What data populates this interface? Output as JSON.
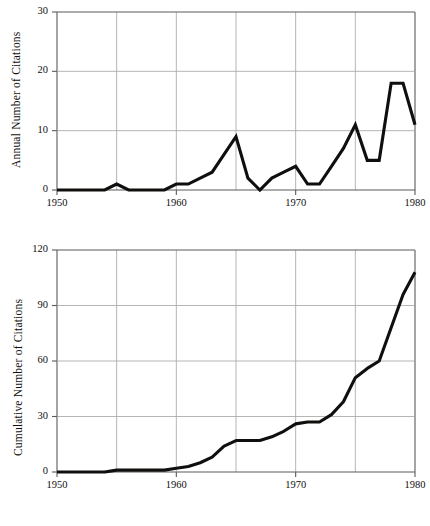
{
  "figure": {
    "background_color": "#ffffff",
    "line_color": "#100f0d",
    "grid_color": "#a8a8a8",
    "axis_color": "#5a5a5a"
  },
  "chart_data": [
    {
      "type": "line",
      "id": "annual-citations",
      "title": "",
      "xlabel": "",
      "ylabel": "Annual Number of Citations",
      "xlim": [
        1950,
        1980
      ],
      "ylim": [
        0,
        30
      ],
      "xticks": [
        1950,
        1960,
        1970,
        1980
      ],
      "xtick_labels": [
        "1950",
        "1960",
        "1970",
        "1980"
      ],
      "yticks": [
        0,
        10,
        20,
        30
      ],
      "ytick_labels": [
        "0",
        "10",
        "20",
        "30"
      ],
      "gridlines_x": [
        1950,
        1955,
        1960,
        1965,
        1970,
        1975,
        1980
      ],
      "gridlines_y": [
        0,
        10,
        20,
        30
      ],
      "grid": true,
      "legend": "none",
      "x": [
        1950,
        1951,
        1952,
        1953,
        1954,
        1955,
        1956,
        1957,
        1958,
        1959,
        1960,
        1961,
        1962,
        1963,
        1964,
        1965,
        1966,
        1967,
        1968,
        1969,
        1970,
        1971,
        1972,
        1973,
        1974,
        1975,
        1976,
        1977,
        1978,
        1979,
        1980
      ],
      "values": [
        0,
        0,
        0,
        0,
        0,
        1,
        0,
        0,
        0,
        0,
        1,
        1,
        2,
        3,
        6,
        9,
        2,
        0,
        2,
        3,
        4,
        1,
        1,
        4,
        7,
        11,
        5,
        5,
        18,
        18,
        11
      ]
    },
    {
      "type": "line",
      "id": "cumulative-citations",
      "title": "",
      "xlabel": "",
      "ylabel": "Cumulative Number of Citations",
      "xlim": [
        1950,
        1980
      ],
      "ylim": [
        0,
        120
      ],
      "xticks": [
        1950,
        1960,
        1970,
        1980
      ],
      "xtick_labels": [
        "1950",
        "1960",
        "1970",
        "1980"
      ],
      "yticks": [
        0,
        30,
        60,
        90,
        120
      ],
      "ytick_labels": [
        "0",
        "30",
        "60",
        "90",
        "120"
      ],
      "gridlines_x": [
        1950,
        1955,
        1960,
        1965,
        1970,
        1975,
        1980
      ],
      "gridlines_y": [
        0,
        30,
        60,
        90,
        120
      ],
      "grid": true,
      "legend": "none",
      "x": [
        1950,
        1951,
        1952,
        1953,
        1954,
        1955,
        1956,
        1957,
        1958,
        1959,
        1960,
        1961,
        1962,
        1963,
        1964,
        1965,
        1966,
        1967,
        1968,
        1969,
        1970,
        1971,
        1972,
        1973,
        1974,
        1975,
        1976,
        1977,
        1978,
        1979,
        1980
      ],
      "values": [
        0,
        0,
        0,
        0,
        0,
        1,
        1,
        1,
        1,
        1,
        2,
        3,
        5,
        8,
        14,
        17,
        17,
        17,
        19,
        22,
        26,
        27,
        27,
        31,
        38,
        51,
        56,
        60,
        78,
        96,
        108
      ]
    }
  ]
}
